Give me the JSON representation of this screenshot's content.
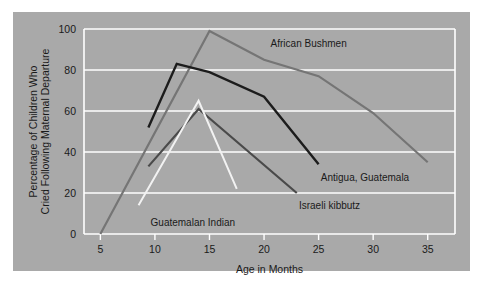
{
  "figure": {
    "background_color": "#ffffff",
    "panel_color": "#a9a9a9",
    "grid_color": "#ffffff",
    "text_color": "#1a1a1a"
  },
  "chart_data": {
    "type": "line",
    "title": "",
    "xlabel": "Age in Months",
    "ylabel": "Percentage of Children Who Cried Following Maternal Departure",
    "ylabel_line1": "Percentage of Children Who",
    "ylabel_line2": "Cried Following Maternal Departure",
    "xlim": [
      3.5,
      37.5
    ],
    "ylim": [
      0,
      100
    ],
    "xticks": [
      5,
      10,
      15,
      20,
      25,
      30,
      35
    ],
    "xtick_labels": [
      "5",
      "10",
      "15",
      "20",
      "25",
      "30",
      "35"
    ],
    "yticks": [
      0,
      20,
      40,
      60,
      80,
      100
    ],
    "ytick_labels": [
      "0",
      "20",
      "40",
      "60",
      "80",
      "100"
    ],
    "grid": "horizontal",
    "legend_position": "inline-annotations",
    "series": [
      {
        "name": "African Bushmen",
        "color": "#757575",
        "width": 2.2,
        "x": [
          5,
          15,
          20,
          25,
          30,
          35
        ],
        "y": [
          0,
          99,
          85,
          77,
          59,
          35
        ],
        "label": "African Bushmen",
        "label_x": 20.6,
        "label_y": 93
      },
      {
        "name": "Antigua, Guatemala",
        "color": "#1c1c1c",
        "width": 2.4,
        "x": [
          9.4,
          12,
          15,
          20,
          25
        ],
        "y": [
          52,
          83,
          79,
          67,
          34
        ],
        "label": "Antigua, Guatemala",
        "label_x": 25.2,
        "label_y": 28
      },
      {
        "name": "Israeli kibbutz",
        "color": "#4a4a4a",
        "width": 2.2,
        "x": [
          9.4,
          14,
          23
        ],
        "y": [
          33,
          61,
          20
        ],
        "label": "Israeli kibbutz",
        "label_x": 23.2,
        "label_y": 14
      },
      {
        "name": "Guatemalan Indian",
        "color": "#f2f2f2",
        "width": 2.0,
        "x": [
          8.5,
          14,
          17.5
        ],
        "y": [
          14,
          65,
          22
        ],
        "label": "Guatemalan Indian",
        "label_x": 9.6,
        "label_y": 6
      }
    ]
  }
}
